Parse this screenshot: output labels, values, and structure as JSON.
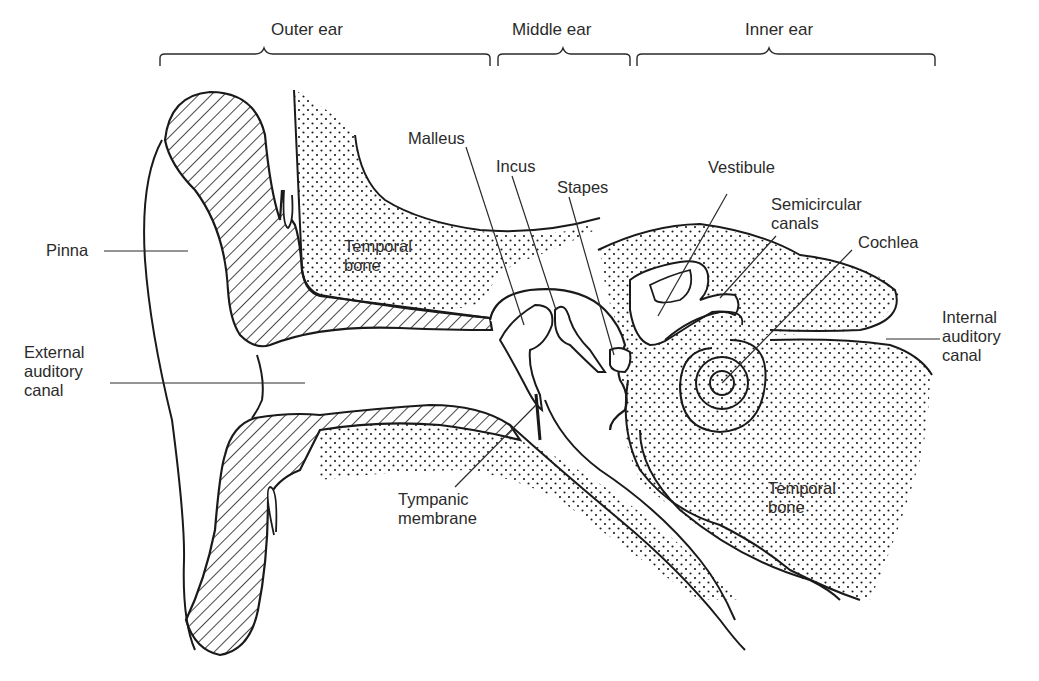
{
  "diagram": {
    "sections": [
      {
        "label": "Outer ear"
      },
      {
        "label": "Middle ear"
      },
      {
        "label": "Inner ear"
      }
    ],
    "labels": {
      "pinna": "Pinna",
      "external_auditory_canal": [
        "External",
        "auditory",
        "canal"
      ],
      "temporal_bone_upper": [
        "Temporal",
        "bone"
      ],
      "malleus": "Malleus",
      "incus": "Incus",
      "stapes": "Stapes",
      "vestibule": "Vestibule",
      "semicircular_canals": [
        "Semicircular",
        "canals"
      ],
      "cochlea": "Cochlea",
      "internal_auditory_canal": [
        "Internal",
        "auditory",
        "canal"
      ],
      "tympanic_membrane": [
        "Tympanic",
        "membrane"
      ],
      "temporal_bone_lower": [
        "Temporal",
        "bone"
      ]
    },
    "legend_patterns": {
      "cartilage": "diagonal-hatch",
      "bone": "stipple-dots"
    },
    "colors": {
      "ink": "#1a1a1a",
      "label_text": "#2b2b2b",
      "background": "#ffffff"
    }
  }
}
